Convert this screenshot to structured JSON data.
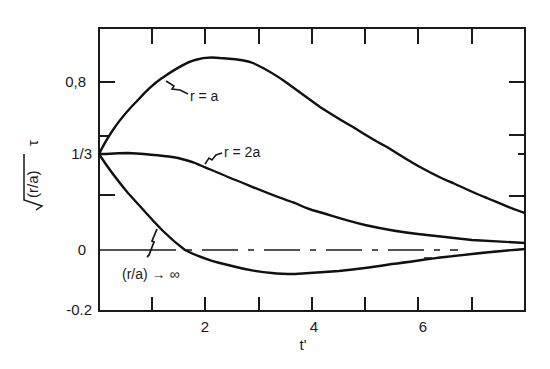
{
  "chart_data": {
    "type": "line",
    "title": "",
    "xlabel": "t'",
    "ylabel": "√(r/a) τ",
    "xlim": [
      0,
      8
    ],
    "ylim": [
      -0.2,
      1.0
    ],
    "grid": false,
    "legend": "inline curve labels",
    "x_ticks": [
      {
        "value": 1,
        "label": ""
      },
      {
        "value": 2,
        "label": "2"
      },
      {
        "value": 3,
        "label": ""
      },
      {
        "value": 4,
        "label": "4"
      },
      {
        "value": 5,
        "label": ""
      },
      {
        "value": 6,
        "label": "6"
      },
      {
        "value": 7,
        "label": ""
      }
    ],
    "y_ticks": [
      {
        "value": 0.8,
        "label": "0,8"
      },
      {
        "value": 0.45,
        "label": ""
      },
      {
        "value": 0.3333,
        "label": "1/3"
      },
      {
        "value": 0.17,
        "label": ""
      },
      {
        "value": 0.0,
        "label": "0"
      },
      {
        "value": -0.2,
        "label": "-0.2"
      }
    ],
    "reference_line": {
      "y": 0,
      "style": "dash-dot",
      "x_range": [
        0,
        6.7
      ]
    },
    "series": [
      {
        "name": "r = a",
        "x": [
          0,
          0.3,
          0.73,
          1.18,
          1.8,
          2.27,
          2.89,
          3.53,
          4.15,
          4.77,
          5.41,
          6.03,
          6.65,
          7.28,
          8.0
        ],
        "y": [
          0.333,
          0.51,
          0.68,
          0.83,
          0.94,
          0.955,
          0.92,
          0.79,
          0.64,
          0.51,
          0.38,
          0.29,
          0.23,
          0.18,
          0.13
        ]
      },
      {
        "name": "r = 2a",
        "x": [
          0,
          0.54,
          1.48,
          1.8,
          2.42,
          3.68,
          4.0,
          5.0,
          6.0,
          7.0,
          8.0
        ],
        "y": [
          0.333,
          0.337,
          0.32,
          0.3,
          0.25,
          0.16,
          0.14,
          0.09,
          0.055,
          0.035,
          0.024
        ]
      },
      {
        "name": "(r/a) → ∞",
        "x": [
          0,
          0.54,
          1.18,
          1.6,
          2.42,
          3.25,
          3.68,
          4.5,
          5.5,
          6.5,
          8.0
        ],
        "y": [
          0.333,
          0.2,
          0.07,
          0.0,
          -0.05,
          -0.077,
          -0.08,
          -0.07,
          -0.047,
          -0.023,
          0.003
        ]
      }
    ]
  },
  "render": {
    "frame": {
      "left": 99,
      "top": 28,
      "right": 525,
      "bottom": 311
    },
    "x_px": [
      152,
      205,
      259,
      312,
      365,
      418,
      472
    ],
    "y_tick_px": [
      {
        "y": 82,
        "len": 16
      },
      {
        "y": 136,
        "len": 8
      },
      {
        "y": 154,
        "len": 0
      },
      {
        "y": 195,
        "len": 16
      },
      {
        "y": 250,
        "len": 0
      },
      {
        "y": 310,
        "len": 0
      }
    ],
    "zero_line_y": 250,
    "curves": {
      "r_eq_a": "M99,154 C106,140 110,134 115,127 C124,114 130,108 138,100 C146,91 152,85 162,78 C174,70 184,63 195,60 C204,57 212,57 220,58 C232,59 243,59 253,63 C266,69 276,75 287,83 C298,91 309,99 320,107 C331,114 342,121 353,127 C364,134 375,141 387,147 C398,154 409,161 420,167 C431,173 442,179 453,183 C464,188 476,194 487,198 C499,203 512,209 525,213",
      "r_eq_2a": "M99,154 C110,154 118,153 128,153 C145,154 162,155 178,158 C186,160 190,161 195,163 C206,168 217,172 228,177 C251,186 273,196 295,203 C301,206 306,208 312,210 C330,215 347,221 365,225 C383,229 400,232 418,234 C436,236 454,238 472,240 C490,241 508,242 525,243",
      "r_inf": "M99,154 C108,168 118,181 128,193 C140,206 150,218 162,230 C170,238 177,244 185,250 C199,257 213,262 228,265 C243,269 257,272 272,273 C280,274 287,274 295,274 C310,273 325,272 339,271 C357,269 374,267 392,264 C410,262 427,259 445,257 C471,254 498,251 525,249"
    }
  },
  "labels": {
    "y_axis_title_sqrt": "√",
    "y_axis_title_arg": "(r/a)",
    "y_axis_title_tau": "τ",
    "x_axis_title": "t'",
    "tick_0_8": "0,8",
    "tick_1_3": "1/3",
    "tick_0": "0",
    "tick_neg_0_2": "-0.2",
    "tick_2": "2",
    "tick_4": "4",
    "tick_6": "6",
    "curve_r_a": "r = a",
    "curve_r_2a": "r = 2a",
    "curve_r_inf": "(r/a) → ∞"
  }
}
